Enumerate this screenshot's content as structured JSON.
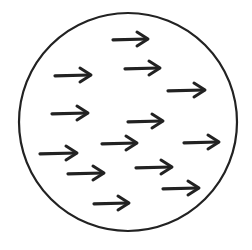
{
  "diagram": {
    "stroke_color": "#222222",
    "background": "#ffffff",
    "circle": {
      "cx": 128,
      "cy": 122,
      "r": 109
    },
    "arrows": [
      {
        "x1": 113,
        "x2": 148,
        "y": 39
      },
      {
        "x1": 55,
        "x2": 91,
        "y": 75
      },
      {
        "x1": 125,
        "x2": 160,
        "y": 68
      },
      {
        "x1": 168,
        "x2": 205,
        "y": 90
      },
      {
        "x1": 52,
        "x2": 88,
        "y": 113
      },
      {
        "x1": 128,
        "x2": 163,
        "y": 121
      },
      {
        "x1": 102,
        "x2": 137,
        "y": 143
      },
      {
        "x1": 184,
        "x2": 219,
        "y": 142
      },
      {
        "x1": 40,
        "x2": 77,
        "y": 153
      },
      {
        "x1": 136,
        "x2": 172,
        "y": 167
      },
      {
        "x1": 68,
        "x2": 104,
        "y": 173
      },
      {
        "x1": 163,
        "x2": 199,
        "y": 188
      },
      {
        "x1": 94,
        "x2": 129,
        "y": 203
      }
    ]
  }
}
